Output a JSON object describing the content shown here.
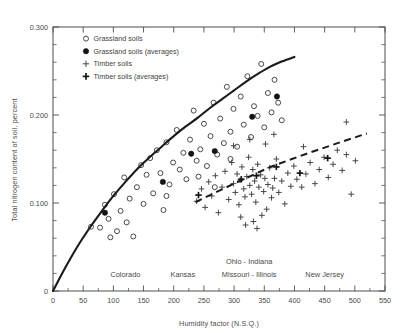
{
  "chart_data": {
    "type": "scatter",
    "title": "",
    "xlabel": "Humidity factor (N.S.Q.)",
    "ylabel": "Total nitrogen content of soil, percent",
    "xlim": [
      0,
      550
    ],
    "ylim": [
      0,
      0.3
    ],
    "xticks": [
      0,
      50,
      100,
      150,
      200,
      250,
      300,
      350,
      400,
      450,
      500,
      550
    ],
    "xtick_labels": [
      "0",
      "50",
      "100",
      "150",
      "200",
      "250",
      "300",
      "350",
      "400",
      "450",
      "500",
      "550"
    ],
    "yticks": [
      0,
      0.1,
      0.2,
      0.3
    ],
    "ytick_labels": [
      "0",
      "0.100",
      "0.200",
      "0.300"
    ],
    "y_minor_step": 0.02,
    "grid": false,
    "legend_position": "upper-left-inside",
    "legend": [
      {
        "label": "Grassland soils",
        "marker": "open-circle"
      },
      {
        "label": "Grassland soils (averages)",
        "marker": "filled-circle"
      },
      {
        "label": "Timber soils",
        "marker": "plus"
      },
      {
        "label": "Timber soils (averages)",
        "marker": "bold-plus"
      }
    ],
    "region_annotations": [
      {
        "text": "Colorado",
        "x": 120,
        "y": 0.016
      },
      {
        "text": "Kansas",
        "x": 215,
        "y": 0.016
      },
      {
        "text": "Ohio - Indiana",
        "x": 325,
        "y": 0.031
      },
      {
        "text": "Missouri - Illinois",
        "x": 325,
        "y": 0.016
      },
      {
        "text": "New Jersey",
        "x": 450,
        "y": 0.016
      }
    ],
    "series": [
      {
        "name": "Grassland soils",
        "marker": "open-circle",
        "points": [
          [
            63,
            0.073
          ],
          [
            78,
            0.072
          ],
          [
            86,
            0.098
          ],
          [
            92,
            0.082
          ],
          [
            95,
            0.061
          ],
          [
            101,
            0.11
          ],
          [
            106,
            0.068
          ],
          [
            112,
            0.091
          ],
          [
            118,
            0.129
          ],
          [
            122,
            0.078
          ],
          [
            127,
            0.105
          ],
          [
            133,
            0.062
          ],
          [
            139,
            0.118
          ],
          [
            146,
            0.143
          ],
          [
            150,
            0.099
          ],
          [
            155,
            0.132
          ],
          [
            161,
            0.151
          ],
          [
            166,
            0.111
          ],
          [
            172,
            0.16
          ],
          [
            178,
            0.134
          ],
          [
            183,
            0.092
          ],
          [
            188,
            0.169
          ],
          [
            193,
            0.121
          ],
          [
            199,
            0.146
          ],
          [
            205,
            0.183
          ],
          [
            210,
            0.138
          ],
          [
            216,
            0.157
          ],
          [
            221,
            0.127
          ],
          [
            227,
            0.172
          ],
          [
            233,
            0.205
          ],
          [
            238,
            0.148
          ],
          [
            244,
            0.161
          ],
          [
            250,
            0.19
          ],
          [
            255,
            0.142
          ],
          [
            261,
            0.176
          ],
          [
            266,
            0.214
          ],
          [
            272,
            0.155
          ],
          [
            277,
            0.196
          ],
          [
            283,
            0.168
          ],
          [
            288,
            0.232
          ],
          [
            294,
            0.181
          ],
          [
            299,
            0.207
          ],
          [
            305,
            0.164
          ],
          [
            311,
            0.221
          ],
          [
            316,
            0.189
          ],
          [
            322,
            0.244
          ],
          [
            328,
            0.175
          ],
          [
            333,
            0.21
          ],
          [
            339,
            0.199
          ],
          [
            345,
            0.258
          ],
          [
            350,
            0.186
          ],
          [
            356,
            0.225
          ],
          [
            362,
            0.203
          ],
          [
            367,
            0.24
          ],
          [
            373,
            0.214
          ],
          [
            379,
            0.194
          ],
          [
            241,
            0.13
          ],
          [
            268,
            0.118
          ],
          [
            294,
            0.15
          ],
          [
            188,
            0.108
          ]
        ]
      },
      {
        "name": "Grassland soils (averages)",
        "marker": "filled-circle",
        "points": [
          [
            86,
            0.089
          ],
          [
            182,
            0.124
          ],
          [
            229,
            0.156
          ],
          [
            268,
            0.159
          ],
          [
            330,
            0.198
          ],
          [
            371,
            0.221
          ]
        ]
      },
      {
        "name": "Timber soils",
        "marker": "plus",
        "points": [
          [
            238,
            0.102
          ],
          [
            246,
            0.116
          ],
          [
            252,
            0.095
          ],
          [
            258,
            0.124
          ],
          [
            263,
            0.108
          ],
          [
            269,
            0.131
          ],
          [
            274,
            0.089
          ],
          [
            280,
            0.118
          ],
          [
            285,
            0.136
          ],
          [
            291,
            0.104
          ],
          [
            296,
            0.146
          ],
          [
            299,
            0.122
          ],
          [
            302,
            0.112
          ],
          [
            305,
            0.133
          ],
          [
            308,
            0.098
          ],
          [
            310,
            0.126
          ],
          [
            313,
            0.141
          ],
          [
            316,
            0.116
          ],
          [
            318,
            0.107
          ],
          [
            321,
            0.13
          ],
          [
            324,
            0.152
          ],
          [
            326,
            0.12
          ],
          [
            329,
            0.11
          ],
          [
            331,
            0.138
          ],
          [
            334,
            0.125
          ],
          [
            336,
            0.101
          ],
          [
            339,
            0.144
          ],
          [
            341,
            0.118
          ],
          [
            344,
            0.132
          ],
          [
            346,
            0.086
          ],
          [
            349,
            0.113
          ],
          [
            351,
            0.128
          ],
          [
            354,
            0.093
          ],
          [
            356,
            0.121
          ],
          [
            359,
            0.14
          ],
          [
            362,
            0.106
          ],
          [
            364,
            0.117
          ],
          [
            367,
            0.128
          ],
          [
            370,
            0.15
          ],
          [
            374,
            0.112
          ],
          [
            379,
            0.125
          ],
          [
            384,
            0.099
          ],
          [
            389,
            0.134
          ],
          [
            394,
            0.119
          ],
          [
            399,
            0.142
          ],
          [
            404,
            0.127
          ],
          [
            412,
            0.118
          ],
          [
            419,
            0.133
          ],
          [
            426,
            0.146
          ],
          [
            434,
            0.122
          ],
          [
            441,
            0.138
          ],
          [
            449,
            0.152
          ],
          [
            456,
            0.129
          ],
          [
            464,
            0.144
          ],
          [
            471,
            0.16
          ],
          [
            479,
            0.137
          ],
          [
            486,
            0.155
          ],
          [
            494,
            0.11
          ],
          [
            501,
            0.148
          ],
          [
            326,
            0.172
          ],
          [
            352,
            0.167
          ],
          [
            366,
            0.178
          ],
          [
            415,
            0.164
          ],
          [
            299,
            0.165
          ],
          [
            311,
            0.084
          ],
          [
            332,
            0.079
          ],
          [
            338,
            0.071
          ],
          [
            486,
            0.192
          ],
          [
            319,
            0.075
          ]
        ]
      },
      {
        "name": "Timber soils (averages)",
        "marker": "bold-plus",
        "points": [
          [
            241,
            0.109
          ],
          [
            312,
            0.127
          ],
          [
            337,
            0.131
          ],
          [
            370,
            0.141
          ],
          [
            409,
            0.134
          ],
          [
            455,
            0.151
          ]
        ]
      }
    ],
    "fitted_curves": [
      {
        "name": "Grassland soils trend",
        "style": "solid",
        "description": "Concave-down curve rising from origin",
        "points": [
          [
            0,
            0.0
          ],
          [
            20,
            0.026
          ],
          [
            40,
            0.05
          ],
          [
            60,
            0.071
          ],
          [
            80,
            0.09
          ],
          [
            100,
            0.108
          ],
          [
            120,
            0.124
          ],
          [
            140,
            0.139
          ],
          [
            160,
            0.152
          ],
          [
            180,
            0.164
          ],
          [
            200,
            0.176
          ],
          [
            220,
            0.187
          ],
          [
            240,
            0.197
          ],
          [
            260,
            0.208
          ],
          [
            280,
            0.218
          ],
          [
            300,
            0.228
          ],
          [
            320,
            0.238
          ],
          [
            340,
            0.247
          ],
          [
            360,
            0.255
          ],
          [
            380,
            0.261
          ],
          [
            400,
            0.266
          ]
        ]
      },
      {
        "name": "Timber soils trend",
        "style": "dashed",
        "description": "Near-linear ascending dashed line",
        "points": [
          [
            236,
            0.101
          ],
          [
            300,
            0.122
          ],
          [
            360,
            0.141
          ],
          [
            420,
            0.156
          ],
          [
            480,
            0.17
          ],
          [
            520,
            0.179
          ]
        ]
      }
    ]
  }
}
